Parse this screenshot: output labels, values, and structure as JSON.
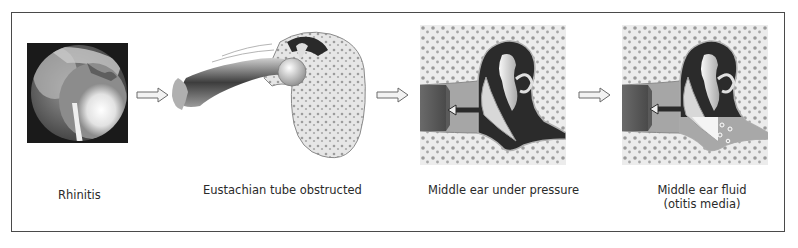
{
  "diagram": {
    "title": "",
    "stages": [
      {
        "id": "rhinitis",
        "label": "Rhinitis",
        "image": "endoscopic-nasal-photo"
      },
      {
        "id": "eustachian",
        "label": "Eustachian tube obstructed",
        "image": "eustachian-tube-illustration"
      },
      {
        "id": "pressure",
        "label": "Middle ear under pressure",
        "image": "middle-ear-cross-section"
      },
      {
        "id": "fluid",
        "label_line1": "Middle ear fluid",
        "label_line2": "(otitis media)",
        "image": "middle-ear-fluid-cross-section"
      }
    ],
    "arrows": [
      "right-arrow",
      "right-arrow",
      "right-arrow"
    ],
    "colors": {
      "border": "#4a4a4a",
      "bone": "#e4e4e4",
      "bone_spots": "#9a9a9a",
      "cavity_dark": "#2b2b2b",
      "tube": "#8a8a8a",
      "fluid": "#a8a8a8",
      "text": "#2a2a2a"
    }
  }
}
